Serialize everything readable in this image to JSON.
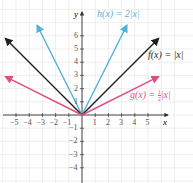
{
  "chart_data": {
    "type": "line",
    "title": "",
    "xlabel": "x",
    "ylabel": "y",
    "xlim": [
      -6,
      6.5
    ],
    "ylim": [
      -4.8,
      7.5
    ],
    "grid": true,
    "x_ticks": [
      -5,
      -4,
      -3,
      -2,
      -1,
      1,
      2,
      3,
      4,
      5
    ],
    "y_ticks": [
      -4,
      -3,
      -2,
      -1,
      1,
      2,
      3,
      4,
      5,
      6
    ],
    "series": [
      {
        "name": "h(x) = 2|x|",
        "color": "#4fb3dc",
        "x": [
          -3.4,
          0,
          3.4
        ],
        "y": [
          6.8,
          0,
          6.8
        ]
      },
      {
        "name": "f(x) = |x|",
        "color": "#231f20",
        "x": [
          -5.8,
          0,
          5.8
        ],
        "y": [
          5.8,
          0,
          5.8
        ]
      },
      {
        "name": "g(x) = ½|x|",
        "color": "#e0507a",
        "x": [
          -5.8,
          0,
          5.8
        ],
        "y": [
          2.9,
          0,
          2.9
        ]
      }
    ],
    "annotations": [
      {
        "text": "h(x) = 2|x|",
        "color": "#4fb3dc"
      },
      {
        "text": "f(x) = |x|",
        "color": "#231f20"
      },
      {
        "text": "g(x) = ½|x|",
        "color": "#e0507a"
      }
    ]
  },
  "labels": {
    "h": "h(x) = 2|x|",
    "f": "f(x) = |x|",
    "g_prefix": "g(x) = ",
    "g_num": "1",
    "g_den": "2",
    "g_suffix": "|x|",
    "x_axis": "x",
    "y_axis": "y"
  }
}
